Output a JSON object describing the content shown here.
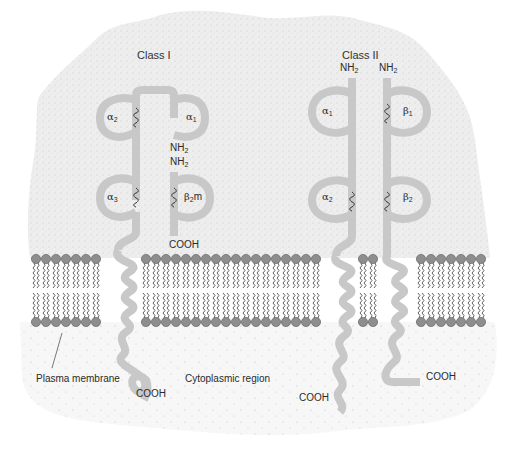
{
  "figure": {
    "class_i": {
      "title": "Class I",
      "alpha_chain": {
        "domains": [
          {
            "label": "α",
            "sub": "1"
          },
          {
            "label": "α",
            "sub": "2"
          },
          {
            "label": "α",
            "sub": "3"
          }
        ],
        "n_terminus": {
          "text": "NH",
          "sub": "2"
        },
        "c_terminus": "COOH"
      },
      "beta2m": {
        "label": "β",
        "sub": "2",
        "suffix": "m",
        "n_terminus": {
          "text": "NH",
          "sub": "2"
        },
        "c_terminus": "COOH"
      },
      "disulfide": "S–S"
    },
    "class_ii": {
      "title": "Class II",
      "alpha_chain": {
        "domains": [
          {
            "label": "α",
            "sub": "1"
          },
          {
            "label": "α",
            "sub": "2"
          }
        ],
        "n_terminus": {
          "text": "NH",
          "sub": "2"
        },
        "c_terminus": "COOH"
      },
      "beta_chain": {
        "domains": [
          {
            "label": "β",
            "sub": "1"
          },
          {
            "label": "β",
            "sub": "2"
          }
        ],
        "n_terminus": {
          "text": "NH",
          "sub": "2"
        },
        "c_terminus": "COOH"
      }
    },
    "labels": {
      "plasma_membrane": "Plasma membrane",
      "cytoplasmic_region": "Cytoplasmic region"
    },
    "colors": {
      "protein": "#c8c8c8",
      "stipple_bg": "#ebebeb",
      "lipid_head": "#8e8e8e",
      "lipid_tail": "#3a3a3a",
      "text": "#2a2a2a"
    }
  }
}
